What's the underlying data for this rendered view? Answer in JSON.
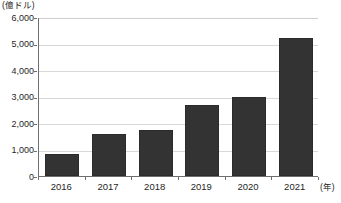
{
  "chart_data": {
    "type": "bar",
    "title": "",
    "unit_label": "(億ドル)",
    "xlabel": "(年)",
    "ylabel": "",
    "categories": [
      "2016",
      "2017",
      "2018",
      "2019",
      "2020",
      "2021"
    ],
    "values": [
      850,
      1600,
      1720,
      2700,
      3000,
      5200
    ],
    "series": [
      {
        "name": "",
        "values": [
          850,
          1600,
          1720,
          2700,
          3000,
          5200
        ]
      }
    ],
    "ylim": [
      0,
      6000
    ],
    "ytick_values": [
      0,
      1000,
      2000,
      3000,
      4000,
      5000,
      6000
    ],
    "ytick_labels": [
      "0",
      "1,000",
      "2,000",
      "3,000",
      "4,000",
      "5,000",
      "6,000"
    ],
    "grid": true,
    "grid_axis": "y",
    "legend": false,
    "legend_position": "none",
    "bar_color": "#333333",
    "gridline_color": "#d8d8d8",
    "axis_color": "#6f6f6f"
  },
  "footer": {
    "source_note": ""
  }
}
